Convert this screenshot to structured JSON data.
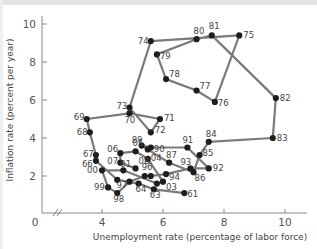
{
  "chart_data": {
    "type": "line",
    "title": "",
    "xlabel": "Unemployment rate (percentage of labor force)",
    "ylabel": "Inflation rate (percent per year)",
    "xlim": [
      0,
      11
    ],
    "ylim": [
      0,
      10.5
    ],
    "x_axis_break": true,
    "grid": false,
    "legend": null,
    "x_ticks": [
      0,
      4,
      6,
      8,
      10
    ],
    "y_ticks": [
      2,
      4,
      6,
      8,
      10
    ],
    "line_color": "#7a7a7a",
    "marker_color": "#1e1e1e",
    "series": [
      {
        "name": "US unemployment vs inflation by year (1961-2008)",
        "points": [
          {
            "label": "61",
            "x": 6.7,
            "y": 1.1
          },
          {
            "label": "63",
            "x": 5.7,
            "y": 1.3
          },
          {
            "label": "64",
            "x": 5.2,
            "y": 1.6
          },
          {
            "label": "65",
            "x": 4.5,
            "y": 1.8
          },
          {
            "label": "66",
            "x": 3.8,
            "y": 2.8
          },
          {
            "label": "67",
            "x": 3.8,
            "y": 3.1
          },
          {
            "label": "68",
            "x": 3.6,
            "y": 4.3
          },
          {
            "label": "69",
            "x": 3.5,
            "y": 5.0
          },
          {
            "label": "70",
            "x": 4.9,
            "y": 5.3
          },
          {
            "label": "71",
            "x": 5.9,
            "y": 5.0
          },
          {
            "label": "72",
            "x": 5.6,
            "y": 4.3
          },
          {
            "label": "73",
            "x": 4.9,
            "y": 5.6
          },
          {
            "label": "74",
            "x": 5.6,
            "y": 9.1
          },
          {
            "label": "75",
            "x": 8.5,
            "y": 9.4
          },
          {
            "label": "76",
            "x": 7.7,
            "y": 5.9
          },
          {
            "label": "77",
            "x": 7.1,
            "y": 6.5
          },
          {
            "label": "78",
            "x": 6.1,
            "y": 7.1
          },
          {
            "label": "79",
            "x": 5.8,
            "y": 8.4
          },
          {
            "label": "80",
            "x": 7.1,
            "y": 9.2
          },
          {
            "label": "81",
            "x": 7.6,
            "y": 9.4
          },
          {
            "label": "82",
            "x": 9.7,
            "y": 6.1
          },
          {
            "label": "83",
            "x": 9.6,
            "y": 4.0
          },
          {
            "label": "84",
            "x": 7.5,
            "y": 3.8
          },
          {
            "label": "85",
            "x": 7.2,
            "y": 3.1
          },
          {
            "label": "86",
            "x": 7.0,
            "y": 2.2
          },
          {
            "label": "87",
            "x": 6.2,
            "y": 2.7
          },
          {
            "label": "88",
            "x": 5.5,
            "y": 3.4
          },
          {
            "label": "89",
            "x": 5.3,
            "y": 3.6
          },
          {
            "label": "90",
            "x": 5.6,
            "y": 3.5
          },
          {
            "label": "91",
            "x": 6.8,
            "y": 3.5
          },
          {
            "label": "92",
            "x": 7.5,
            "y": 2.4
          },
          {
            "label": "93",
            "x": 6.9,
            "y": 2.4
          },
          {
            "label": "94",
            "x": 6.1,
            "y": 2.1
          },
          {
            "label": "95",
            "x": 5.6,
            "y": 2.0
          },
          {
            "label": "96",
            "x": 5.4,
            "y": 2.0
          },
          {
            "label": "97",
            "x": 4.9,
            "y": 1.7
          },
          {
            "label": "98",
            "x": 4.5,
            "y": 1.1
          },
          {
            "label": "99",
            "x": 4.2,
            "y": 1.4
          },
          {
            "label": "00",
            "x": 4.0,
            "y": 2.3
          },
          {
            "label": "01",
            "x": 4.7,
            "y": 2.3
          },
          {
            "label": "02",
            "x": 5.8,
            "y": 1.6
          },
          {
            "label": "03",
            "x": 6.0,
            "y": 1.7
          },
          {
            "label": "04",
            "x": 5.5,
            "y": 2.9
          },
          {
            "label": "05",
            "x": 5.1,
            "y": 3.3
          },
          {
            "label": "06",
            "x": 4.6,
            "y": 3.2
          },
          {
            "label": "07",
            "x": 4.6,
            "y": 2.7
          },
          {
            "label": "08",
            "x": 5.1,
            "y": 2.4
          }
        ]
      }
    ]
  }
}
